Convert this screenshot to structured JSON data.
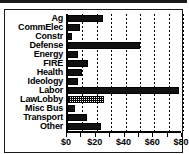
{
  "chart_data": {
    "type": "bar",
    "orientation": "horizontal",
    "title": "",
    "xlabel": "",
    "ylabel": "",
    "xlim": [
      0,
      80
    ],
    "grid": true,
    "legend": "none",
    "categories": [
      "Ag",
      "CommElec",
      "Constr",
      "Defense",
      "Energy",
      "FIRE",
      "Health",
      "Ideology",
      "Labor",
      "LawLobby",
      "Misc Bus",
      "Transport",
      "Other"
    ],
    "values": [
      24,
      8,
      3,
      50,
      7,
      14,
      10,
      7,
      77,
      25,
      5,
      13,
      23
    ],
    "bar_styles": [
      "solid",
      "solid",
      "solid",
      "solid",
      "solid",
      "solid",
      "solid",
      "solid",
      "solid",
      "hatch",
      "solid",
      "solid",
      "solid"
    ],
    "gridline_values": [
      0,
      10,
      20,
      30,
      40,
      50,
      60,
      70,
      80
    ],
    "xtick_values": [
      0,
      10,
      20,
      30,
      40,
      50,
      60,
      70,
      80
    ],
    "xticklabels": [
      {
        "value": 0,
        "label": "$0"
      },
      {
        "value": 20,
        "label": "$20"
      },
      {
        "value": 40,
        "label": "$40"
      },
      {
        "value": 60,
        "label": "$60"
      },
      {
        "value": 80,
        "label": "$80"
      }
    ],
    "colors": {
      "bar_fill": "#111111",
      "bar_edge": "#000000",
      "hatch_fill": "#ffffff",
      "axis": "#000000",
      "background": "#ffffff",
      "text": "#000000"
    }
  }
}
